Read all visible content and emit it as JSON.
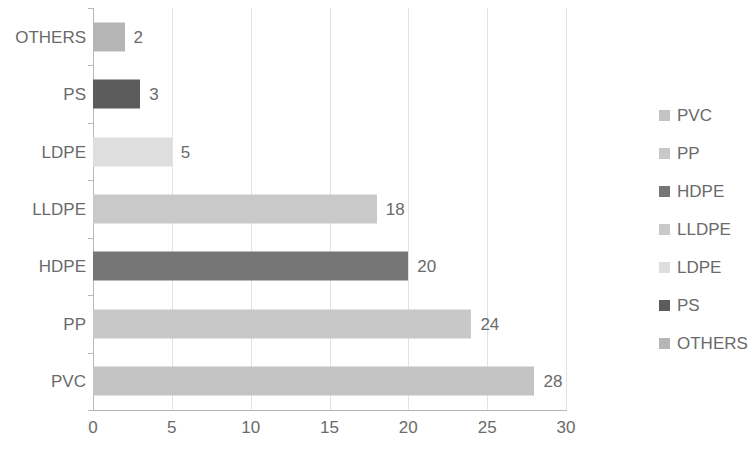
{
  "chart_data": {
    "type": "bar",
    "orientation": "horizontal",
    "title": "",
    "xlabel": "",
    "ylabel": "",
    "categories": [
      "PVC",
      "PP",
      "HDPE",
      "LLDPE",
      "LDPE",
      "PS",
      "OTHERS"
    ],
    "values": [
      28,
      24,
      20,
      18,
      5,
      3,
      2
    ],
    "data_labels": [
      "28",
      "24",
      "20",
      "18",
      "5",
      "3",
      "2"
    ],
    "colors": [
      "#c3c3c3",
      "#c8c8c8",
      "#767676",
      "#c9c9c9",
      "#dedede",
      "#5c5c5c",
      "#b6b6b6"
    ],
    "xlim": [
      0,
      30
    ],
    "xticks": [
      0,
      5,
      10,
      15,
      20,
      25,
      30
    ],
    "xtick_labels": [
      "0",
      "5",
      "10",
      "15",
      "20",
      "25",
      "30"
    ],
    "grid": "vertical",
    "legend_position": "right",
    "legend_entries": [
      {
        "label": "PVC",
        "color": "#c3c3c3"
      },
      {
        "label": "PP",
        "color": "#c8c8c8"
      },
      {
        "label": "HDPE",
        "color": "#767676"
      },
      {
        "label": "LLDPE",
        "color": "#c9c9c9"
      },
      {
        "label": "LDPE",
        "color": "#dedede"
      },
      {
        "label": "PS",
        "color": "#5c5c5c"
      },
      {
        "label": "OTHERS",
        "color": "#b6b6b6"
      }
    ],
    "axis_color": "#b7b7b7",
    "grid_color": "#e2e2e2",
    "text_color": "#6a6a6a"
  }
}
